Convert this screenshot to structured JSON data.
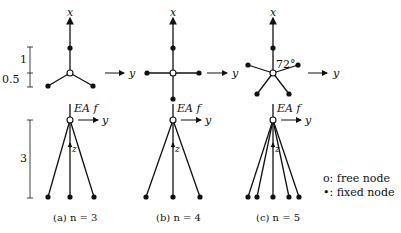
{
  "figure": {
    "axis_labels": {
      "x": "x",
      "y": "y",
      "z": "z"
    },
    "load_label": "EA f",
    "angle_label": "72°",
    "dims": {
      "top_1": "1",
      "top_05": "0.5",
      "bottom_3": "3"
    },
    "panels": [
      {
        "id": "a",
        "caption": "(a) n = 3",
        "n": 3
      },
      {
        "id": "b",
        "caption": "(b) n = 4",
        "n": 4
      },
      {
        "id": "c",
        "caption": "(c) n = 5",
        "n": 5
      }
    ],
    "legend": {
      "free": "o: free node",
      "fixed": "•: fixed node"
    },
    "colors": {
      "line": "#111111",
      "background": "#ffffff"
    }
  }
}
